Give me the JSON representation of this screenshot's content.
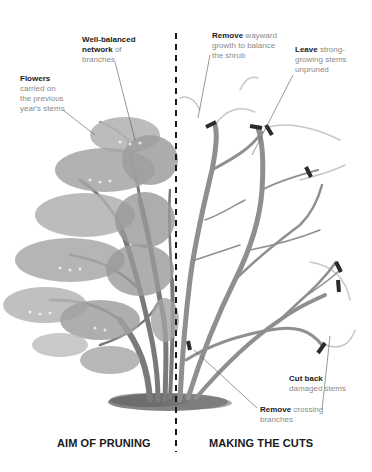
{
  "colors": {
    "foliage_light": "#b5b5b5",
    "foliage_mid": "#9e9e9e",
    "foliage_dark": "#8c8c8c",
    "branch_left": "#7a7a7a",
    "branch_right": "#8f8f8f",
    "branch_faint": "#c8c8c8",
    "cut_mark": "#2b2b2b",
    "ground": "#6e6e6e",
    "divider": "#1a1a1a",
    "leader_line": "#555555",
    "label_bold": "#1a1a1a",
    "label_light": "#8a8a8a"
  },
  "left_panel": {
    "heading": "AIM OF PRUNING",
    "annotations": [
      {
        "bold": "Well-balanced",
        "bold2": "network",
        "text": " of",
        "text2": "branches"
      },
      {
        "bold": "Flowers",
        "lines": [
          "carried on",
          "the previous",
          "year's stems"
        ]
      }
    ]
  },
  "right_panel": {
    "heading": "MAKING THE CUTS",
    "annotations": [
      {
        "bold": "Remove",
        "text": " wayward",
        "lines": [
          "growth to balance",
          "the shrub"
        ]
      },
      {
        "bold": "Leave",
        "text": " strong-",
        "lines": [
          "growing stems",
          "unpruned"
        ]
      },
      {
        "bold": "Cut back",
        "lines": [
          "damaged stems"
        ]
      },
      {
        "bold": "Remove",
        "text": " crossing",
        "lines": [
          "branches"
        ]
      }
    ],
    "cut_marks_count": 8
  }
}
